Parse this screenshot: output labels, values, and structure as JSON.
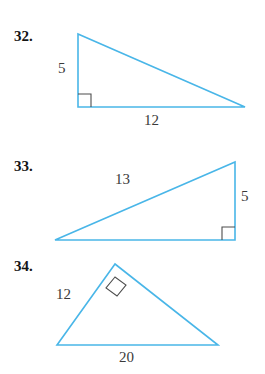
{
  "document": {
    "kind": "geometry-exercise-set",
    "accent_color": "#49b6e8",
    "angle_mark_color": "#4d4d4d",
    "text_color": "#141414"
  },
  "problems": [
    {
      "number": "32.",
      "figure": {
        "type": "right-triangle",
        "right_angle_at": "bottom-left",
        "vertices": {
          "apex": [
            78,
            34
          ],
          "right_angle": [
            78,
            107
          ],
          "far": [
            245,
            107
          ]
        },
        "labels": [
          {
            "text": "5",
            "x": 58,
            "y": 60,
            "side": "vertical-leg"
          },
          {
            "text": "12",
            "x": 144,
            "y": 112,
            "side": "horizontal-leg"
          }
        ]
      }
    },
    {
      "number": "33.",
      "figure": {
        "type": "right-triangle",
        "right_angle_at": "bottom-right",
        "vertices": {
          "apex": [
            235,
            162
          ],
          "right_angle": [
            235,
            240
          ],
          "far": [
            55,
            240
          ]
        },
        "labels": [
          {
            "text": "13",
            "x": 115,
            "y": 171,
            "side": "hypotenuse"
          },
          {
            "text": "5",
            "x": 241,
            "y": 188,
            "side": "vertical-leg"
          }
        ]
      }
    },
    {
      "number": "34.",
      "figure": {
        "type": "right-triangle",
        "right_angle_at": "apex",
        "vertices": {
          "apex": [
            115,
            264
          ],
          "left": [
            57,
            345
          ],
          "right": [
            218,
            345
          ]
        },
        "labels": [
          {
            "text": "12",
            "x": 56,
            "y": 286,
            "side": "left-leg"
          },
          {
            "text": "20",
            "x": 119,
            "y": 349,
            "side": "base"
          }
        ]
      }
    }
  ]
}
